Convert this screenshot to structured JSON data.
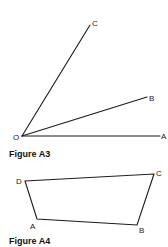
{
  "figures": [
    {
      "caption": "Figure A3",
      "type": "angles",
      "vertex": {
        "label": "O",
        "x": 22,
        "y": 136
      },
      "rays": [
        {
          "label": "C",
          "x": 90,
          "y": 25
        },
        {
          "label": "B",
          "x": 147,
          "y": 97
        },
        {
          "label": "A",
          "x": 160,
          "y": 136
        }
      ]
    },
    {
      "caption": "Figure A4",
      "type": "quadrilateral",
      "vertices": [
        {
          "label": "D",
          "x": 25,
          "y": 181
        },
        {
          "label": "C",
          "x": 154,
          "y": 174
        },
        {
          "label": "B",
          "x": 137,
          "y": 225
        },
        {
          "label": "A",
          "x": 37,
          "y": 219
        }
      ]
    }
  ],
  "colors": {
    "line": "#1a1a1a",
    "background": "#ffffff"
  }
}
